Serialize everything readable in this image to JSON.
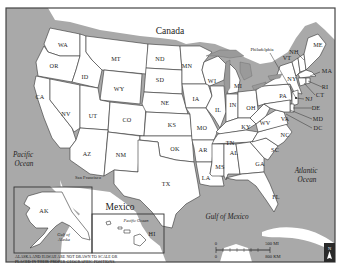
{
  "map": {
    "countries": {
      "north": "Canada",
      "south": "Mexico"
    },
    "water_bodies": {
      "pacific_main": [
        "Pacific",
        "Ocean"
      ],
      "atlantic": [
        "Atlantic",
        "Ocean"
      ],
      "gulf": "Gulf of Mexico",
      "pacific_inset": "Pacific Ocean",
      "gulf_alaska": [
        "Gulf of",
        "Alaska"
      ]
    },
    "cities": {
      "philadelphia": "Philadelphia",
      "san_francisco": "San Francisco"
    },
    "states": {
      "WA": "WA",
      "OR": "OR",
      "CA": "CA",
      "ID": "ID",
      "NV": "NV",
      "MT": "MT",
      "WY": "WY",
      "UT": "UT",
      "CO": "CO",
      "AZ": "AZ",
      "NM": "NM",
      "ND": "ND",
      "SD": "SD",
      "NE": "NE",
      "KS": "KS",
      "OK": "OK",
      "TX": "TX",
      "MN": "MN",
      "IA": "IA",
      "MO": "MO",
      "AR": "AR",
      "LA": "LA",
      "WI": "WI",
      "IL": "IL",
      "MI": "MI",
      "IN": "IN",
      "OH": "OH",
      "KY": "KY",
      "TN": "TN",
      "MS": "MS",
      "AL": "AL",
      "GA": "GA",
      "FL": "FL",
      "SC": "SC",
      "NC": "NC",
      "VA": "VA",
      "WV": "WV",
      "PA": "PA",
      "NY": "NY",
      "VT": "VT",
      "NH": "NH",
      "ME": "ME",
      "MA": "MA",
      "RI": "RI",
      "CT": "CT",
      "NJ": "NJ",
      "DE": "DE",
      "MD": "MD",
      "DC": "DC",
      "AK": "AK",
      "HI": "HI"
    },
    "inset_note": [
      "ALASKA AND HAWAII ARE NOT DRAWN TO SCALE OR",
      "PLACED IN THEIR PROPER GEOGRAPHIC POSITIONS."
    ],
    "scale_bar": {
      "top_zero": "0",
      "top_max": "500 MI",
      "bottom_zero": "0",
      "bottom_max": "800 KM"
    },
    "north_arrow": {
      "label": "N"
    },
    "colors": {
      "water": "#a9a9a9",
      "land": "#ffffff",
      "border": "#333333"
    }
  }
}
